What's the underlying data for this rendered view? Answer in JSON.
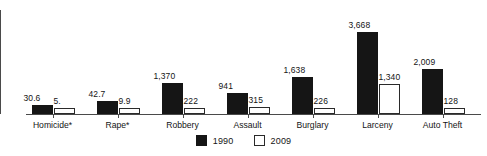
{
  "chart_data": {
    "type": "bar",
    "title": "",
    "subtitle": "",
    "xlabel": "",
    "ylabel": "",
    "grid": false,
    "legend_position": "bottom-center",
    "ylim": [
      0,
      3668
    ],
    "categories": [
      "Homicide*",
      "Rape*",
      "Robbery",
      "Assault",
      "Burglary",
      "Larceny",
      "Auto Theft"
    ],
    "series": [
      {
        "name": "1990",
        "style": "filled",
        "color": "#151515",
        "values": [
          30.6,
          42.7,
          1370,
          941,
          1638,
          3668,
          2009
        ],
        "labels": [
          "30.6",
          "42.7",
          "1,370",
          "941",
          "1,638",
          "3,668",
          "2,009"
        ]
      },
      {
        "name": "2009",
        "style": "open",
        "color": "#ffffff",
        "values": [
          5.0,
          9.9,
          222,
          315,
          226,
          1340,
          128
        ],
        "labels": [
          "5.",
          "9.9",
          "222",
          "315",
          "226",
          "1,340",
          "128"
        ]
      }
    ]
  },
  "legend": {
    "items": [
      {
        "label": "1990",
        "swatch": "filled-square"
      },
      {
        "label": "2009",
        "swatch": "open-square"
      }
    ]
  },
  "axes": {
    "y_axis_icon": "vertical-axis-line",
    "x_axis_icon": "horizontal-axis-line"
  }
}
